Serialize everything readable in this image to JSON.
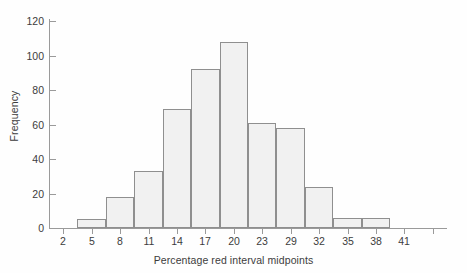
{
  "chart_data": {
    "type": "bar",
    "title": "",
    "subtitle": "",
    "xlabel": "Percentage red interval midpoints",
    "ylabel": "Frequency",
    "grid": false,
    "legend": null,
    "xlim": [
      0.5,
      42.5
    ],
    "ylim": [
      0,
      120
    ],
    "ytick_values": [
      0,
      20,
      40,
      60,
      80,
      100,
      120
    ],
    "ytick_labels": [
      "0",
      "20",
      "40",
      "60",
      "80",
      "100",
      "120"
    ],
    "xtick_values": [
      2,
      5,
      8,
      11,
      14,
      17,
      20,
      23,
      26,
      29,
      32,
      35,
      38,
      41
    ],
    "xtick_labels": [
      "2",
      "5",
      "8",
      "11",
      "14",
      "17",
      "20",
      "23",
      "29",
      "32",
      "35",
      "38",
      "41"
    ],
    "bin_width": 3,
    "categories": [
      "5",
      "8",
      "11",
      "14",
      "17",
      "20",
      "23",
      "29",
      "32",
      "35",
      "38"
    ],
    "values": [
      5,
      18,
      33,
      69,
      92,
      108,
      61,
      58,
      24,
      6,
      6
    ],
    "bars": [
      {
        "midpoint": 5,
        "left": 3.5,
        "right": 6.5,
        "value": 5
      },
      {
        "midpoint": 8,
        "left": 6.5,
        "right": 9.5,
        "value": 18
      },
      {
        "midpoint": 11,
        "left": 9.5,
        "right": 12.5,
        "value": 33
      },
      {
        "midpoint": 14,
        "left": 12.5,
        "right": 15.5,
        "value": 69
      },
      {
        "midpoint": 17,
        "left": 15.5,
        "right": 18.5,
        "value": 92
      },
      {
        "midpoint": 20,
        "left": 18.5,
        "right": 21.5,
        "value": 108
      },
      {
        "midpoint": 23,
        "left": 21.5,
        "right": 24.5,
        "value": 61
      },
      {
        "midpoint": 29,
        "left": 24.5,
        "right": 27.5,
        "value": 58
      },
      {
        "midpoint": 32,
        "left": 27.5,
        "right": 30.5,
        "value": 24
      },
      {
        "midpoint": 35,
        "left": 30.5,
        "right": 33.5,
        "value": 6
      },
      {
        "midpoint": 38,
        "left": 33.5,
        "right": 36.5,
        "value": 6
      }
    ],
    "colors": {
      "bar_fill": "#f1f1f1",
      "bar_stroke": "#8f8f8f",
      "axis": "#9a9a9a",
      "text": "#3c3c3c",
      "background": "#fefefe"
    }
  }
}
